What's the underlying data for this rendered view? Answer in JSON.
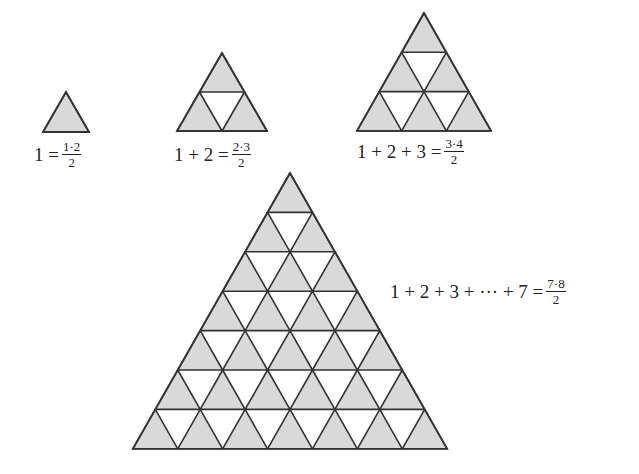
{
  "colors": {
    "fill": "#d9d9d9",
    "stroke": "#333333",
    "background": "#ffffff"
  },
  "figures": [
    {
      "id": "n1",
      "rows": 1,
      "apex": [
        66,
        92
      ],
      "side": 46,
      "height": 40
    },
    {
      "id": "n2",
      "rows": 2,
      "apex": [
        222,
        53
      ],
      "side": 45,
      "height": 39
    },
    {
      "id": "n3",
      "rows": 3,
      "apex": [
        424,
        13
      ],
      "side": 44.7,
      "height": 39.3
    },
    {
      "id": "n7",
      "rows": 7,
      "apex": [
        290,
        173
      ],
      "side": 44.9,
      "height": 39.4
    }
  ],
  "equations": [
    {
      "lhs": "1 = ",
      "num": "1·2",
      "den": "2"
    },
    {
      "lhs": "1 + 2 = ",
      "num": "2·3",
      "den": "2"
    },
    {
      "lhs": "1 + 2 + 3 = ",
      "num": "3·4",
      "den": "2"
    },
    {
      "lhs": "1 + 2 + 3 + ··· + 7 = ",
      "num": "7·8",
      "den": "2"
    }
  ]
}
